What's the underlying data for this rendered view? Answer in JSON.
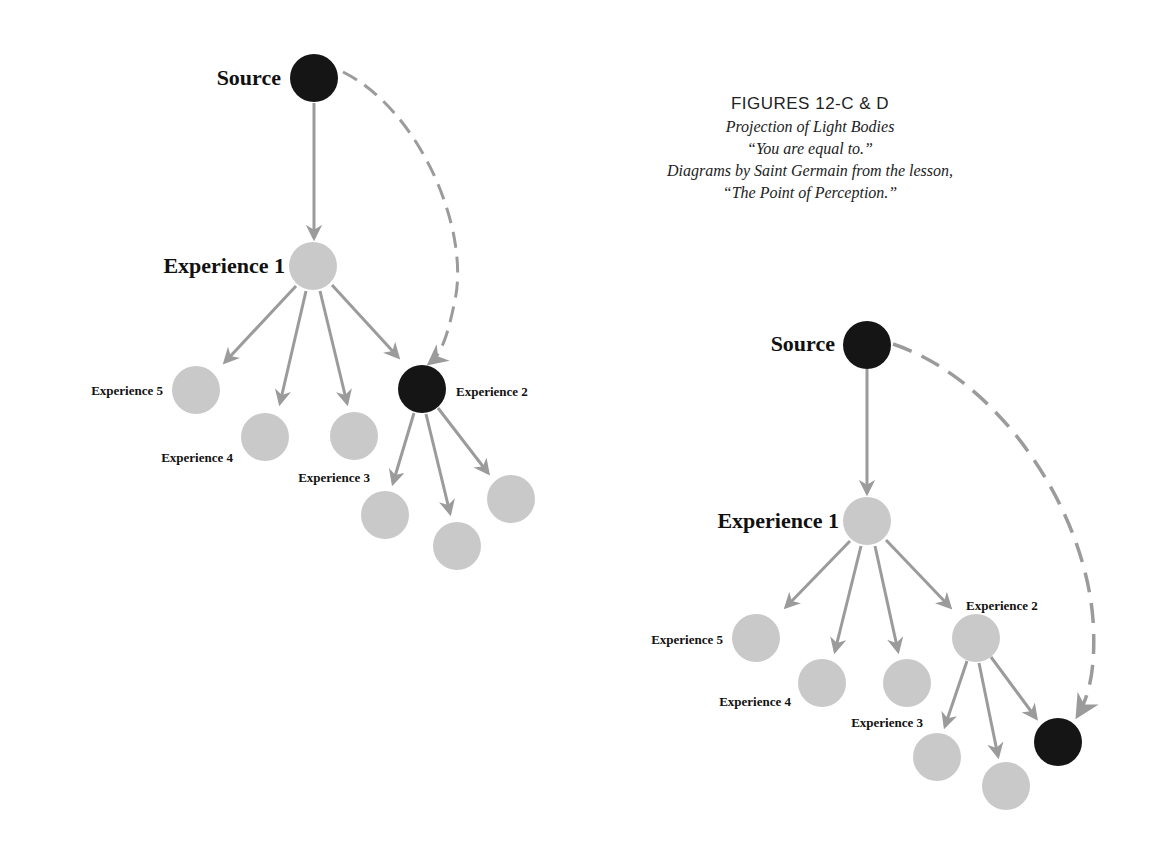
{
  "caption": {
    "title": "FIGURES 12-C & D",
    "subtitle": "Projection of Light Bodies",
    "quote": "“You are equal to.”",
    "credit": "Diagrams by Saint Germain from the lesson,",
    "lesson": "“The Point of Perception.”"
  },
  "colors": {
    "dark_node": "#151515",
    "light_node": "#c9c9c9",
    "arrow": "#9b9b9b",
    "text": "#111111"
  },
  "figure_c": {
    "labels": {
      "source": "Source",
      "exp1": "Experience 1",
      "exp2": "Experience 2",
      "exp3": "Experience 3",
      "exp4": "Experience 4",
      "exp5": "Experience 5"
    }
  },
  "figure_d": {
    "labels": {
      "source": "Source",
      "exp1": "Experience 1",
      "exp2": "Experience 2",
      "exp3": "Experience 3",
      "exp4": "Experience 4",
      "exp5": "Experience 5"
    }
  }
}
